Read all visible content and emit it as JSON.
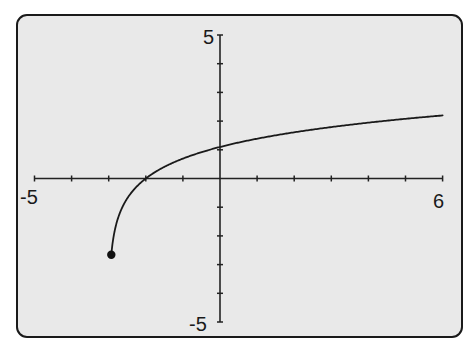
{
  "chart_data": {
    "type": "line",
    "title": "",
    "xlabel": "",
    "ylabel": "",
    "xlim": [
      -5,
      6
    ],
    "ylim": [
      -5,
      5
    ],
    "x_tick_step": 1,
    "y_tick_step": 1,
    "grid": false,
    "legend": null,
    "tick_labels": {
      "x_min": "-5",
      "x_max": "6",
      "y_min": "-5",
      "y_max": "5"
    },
    "series": [
      {
        "name": "y = ln(x + 3)",
        "function": "ln(x+3)",
        "x_start": -2.93,
        "x_end": 6,
        "start_point_marker": "filled-circle",
        "points": [
          {
            "x": -2.93,
            "y": -2.66
          },
          {
            "x": -2.5,
            "y": -0.69
          },
          {
            "x": -2,
            "y": 0
          },
          {
            "x": -1,
            "y": 0.69
          },
          {
            "x": 0,
            "y": 1.1
          },
          {
            "x": 1,
            "y": 1.39
          },
          {
            "x": 2,
            "y": 1.61
          },
          {
            "x": 3,
            "y": 1.79
          },
          {
            "x": 4,
            "y": 1.95
          },
          {
            "x": 5,
            "y": 2.08
          },
          {
            "x": 6,
            "y": 2.2
          }
        ]
      }
    ]
  },
  "colors": {
    "frame_border": "#1a1a1a",
    "plot_background": "#e9e9e9",
    "axis": "#222222",
    "curve": "#1a1a1a"
  }
}
